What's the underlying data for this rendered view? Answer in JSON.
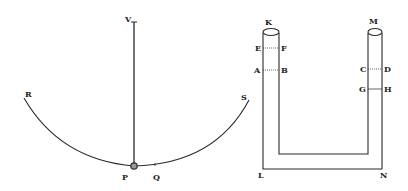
{
  "figure": {
    "pendulum": {
      "labels": {
        "V": "V",
        "R": "R",
        "S": "S",
        "P": "P",
        "Q": "Q"
      }
    },
    "u_tube": {
      "labels": {
        "K": "K",
        "M": "M",
        "E": "E",
        "F": "F",
        "A": "A",
        "B": "B",
        "C": "C",
        "D": "D",
        "G": "G",
        "H": "H",
        "L": "L",
        "N": "N"
      }
    },
    "colors": {
      "ink": "#2a2a2a",
      "paper": "#ffffff"
    }
  }
}
